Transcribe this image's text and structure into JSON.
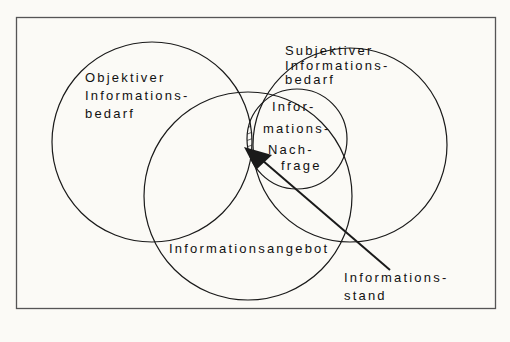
{
  "diagram": {
    "sets": {
      "objektiv": {
        "lines": [
          "Objektiver",
          "Informations-",
          "bedarf"
        ]
      },
      "subjektiv": {
        "lines": [
          "Subjektiver",
          "Informations-",
          "bedarf"
        ]
      },
      "nachfrage": {
        "lines": [
          "Infor-",
          "mations-",
          "Nach-",
          "frage"
        ]
      },
      "angebot": {
        "lines": [
          "Informationsangebot"
        ]
      }
    },
    "callout": {
      "lines": [
        "Informations-",
        "stand"
      ]
    },
    "colors": {
      "line": "#1a1a1a",
      "background": "#fbfaf6",
      "frame": "#555555"
    }
  }
}
